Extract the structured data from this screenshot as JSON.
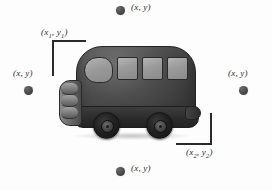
{
  "figure": {
    "type": "annotated-object-detection-illustration",
    "background_color": "#fdfdfd",
    "ink_color": "#2a2a2a"
  },
  "bounding_box": {
    "top_left_label": "(x",
    "top_left_sub": "1",
    "top_left_label_mid": ", y",
    "top_left_sub2": "1",
    "top_left_label_end": ")",
    "bottom_right_label": "(x",
    "bottom_right_sub": "2",
    "bottom_right_label_mid": ", y",
    "bottom_right_sub2": "2",
    "bottom_right_label_end": ")"
  },
  "points": [
    {
      "id": "top",
      "label": "(x, y)",
      "dot_color": "#484848"
    },
    {
      "id": "left",
      "label": "(x, y)",
      "dot_color": "#484848"
    },
    {
      "id": "right",
      "label": "(x, y)",
      "dot_color": "#484848"
    },
    {
      "id": "bottom",
      "label": "(x, y)",
      "dot_color": "#484848"
    }
  ],
  "vehicle": {
    "body_color": "#3b3b3b",
    "window_color": "#9a9a9a",
    "wheel_color": "#1a1a1a",
    "bumper_color": "#7b7b7b",
    "window_count": 4,
    "wheel_count": 2
  }
}
